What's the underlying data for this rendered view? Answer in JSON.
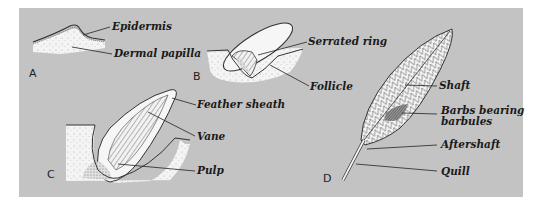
{
  "figure": {
    "panel_color": "#c3c3c3",
    "panels": {
      "A": {
        "letter": "A",
        "labels": [
          "Epidermis",
          "Dermal papilla"
        ]
      },
      "B": {
        "letter": "B",
        "labels": [
          "Serrated ring",
          "Follicle"
        ]
      },
      "C": {
        "letter": "C",
        "labels": [
          "Feather sheath",
          "Vane",
          "Pulp"
        ]
      },
      "D": {
        "letter": "D",
        "labels": [
          "Shaft",
          "Barbs bearing",
          "barbules",
          "Aftershaft",
          "Quill"
        ]
      }
    }
  }
}
